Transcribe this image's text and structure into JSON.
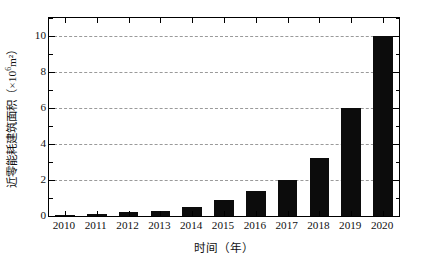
{
  "chart_data": {
    "type": "bar",
    "title": "",
    "subtitle": "",
    "xlabel": "时间（年）",
    "ylabel_prefix": "近零能耗建筑面积（×10",
    "ylabel_sup": "6",
    "ylabel_suffix": "m²）",
    "ylabel_full": "近零能耗建筑面积（×10⁶m²）",
    "categories": [
      "2010",
      "2011",
      "2012",
      "2013",
      "2014",
      "2015",
      "2016",
      "2017",
      "2018",
      "2019",
      "2020"
    ],
    "values": [
      0.02,
      0.1,
      0.25,
      0.3,
      0.5,
      0.9,
      1.4,
      2.0,
      3.2,
      6.0,
      10.0
    ],
    "ylim": [
      0,
      11
    ],
    "xlim_categories": 11,
    "ytick_values": [
      0,
      2,
      4,
      6,
      8,
      10
    ],
    "ytick_labels": [
      "0",
      "2",
      "4",
      "6",
      "8",
      "10"
    ],
    "yminor_values": [
      1,
      3,
      5,
      7,
      9,
      11
    ],
    "grid": true,
    "grid_style": "dashed",
    "grid_axis": "y",
    "legend": "none",
    "bar_color": "#0c0c0c",
    "axis_color": "#000000",
    "grid_color": "#9a9a9a",
    "background_color": "#ffffff",
    "bar_width_ratio": 0.62
  }
}
